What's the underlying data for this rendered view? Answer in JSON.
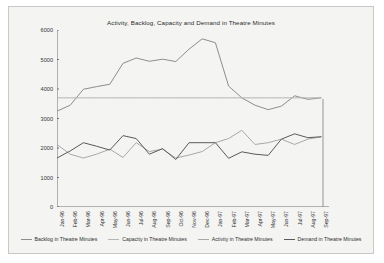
{
  "figure": {
    "background": "#f4f4f2",
    "border_color": "#c8c8c4"
  },
  "chart_data": {
    "type": "line",
    "title": "Activity, Backlog, Capacity and Demand in Theatre Minutes",
    "xlabel": "",
    "ylabel": "",
    "ylim": [
      0,
      6000
    ],
    "ytick_step": 1000,
    "yticks": [
      "0",
      "1000",
      "2000",
      "3000",
      "4000",
      "5000",
      "6000"
    ],
    "grid": false,
    "legend_position": "bottom",
    "categories": [
      "Jan-96",
      "Feb-96",
      "Mar-96",
      "Apr-96",
      "May-96",
      "Jun-96",
      "Jul-96",
      "Aug-96",
      "Sep-96",
      "Oct-96",
      "Nov-96",
      "Dec-96",
      "Jan-97",
      "Feb-97",
      "Mar-97",
      "Apr-97",
      "May-97",
      "Jun-97",
      "Jul-97",
      "Aug-97",
      "Sep-97"
    ],
    "series": [
      {
        "name": "Backlog in Theatre Minutes",
        "color": "#8d8d8d",
        "values": [
          3250,
          3450,
          3990,
          4080,
          4160,
          4870,
          5050,
          4940,
          5010,
          4930,
          5350,
          5700,
          5570,
          4100,
          3700,
          3450,
          3300,
          3420,
          3770,
          3650,
          3700
        ]
      },
      {
        "name": "Capacity in Theatre Minutes",
        "color": "#b5b5b5",
        "values": [
          3700,
          3700,
          3700,
          3700,
          3700,
          3700,
          3700,
          3700,
          3700,
          3700,
          3700,
          3700,
          3700,
          3700,
          3700,
          3700,
          3700,
          3700,
          3700,
          3700,
          3700
        ]
      },
      {
        "name": "Activity in Theatre Minutes",
        "color": "#a8a8a8",
        "values": [
          2120,
          1790,
          1660,
          1790,
          1960,
          1680,
          2180,
          1880,
          1960,
          1660,
          1760,
          1880,
          2180,
          2320,
          2600,
          2120,
          2180,
          2300,
          2120,
          2300,
          2380
        ]
      },
      {
        "name": "Demand in Theatre Minutes",
        "color": "#5a5a5a",
        "values": [
          1660,
          1900,
          2180,
          2060,
          1930,
          2420,
          2320,
          1790,
          1980,
          1610,
          2180,
          2180,
          2180,
          1650,
          1870,
          1790,
          1750,
          2300,
          2480,
          2350,
          2380
        ]
      }
    ]
  }
}
